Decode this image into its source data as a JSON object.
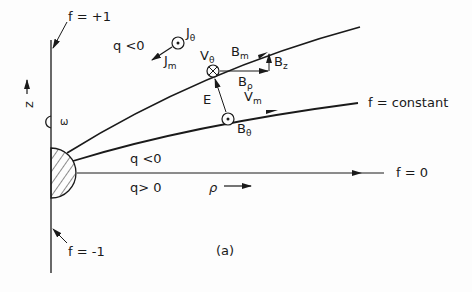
{
  "figure": {
    "caption": "(a)",
    "colors": {
      "ink": "#1a1a1a",
      "background": "#fdfdfd"
    }
  },
  "labels": {
    "f_plus_one": "f = +1",
    "f_minus_one": "f = -1",
    "f_zero": "f = 0",
    "f_constant": "f = constant",
    "q_neg_upper": "q <0",
    "q_neg_lower": "q <0",
    "q_pos": "q> 0",
    "z_axis": "z",
    "rho_axis": "ρ",
    "omega": "ω",
    "J": "J",
    "J_theta_sub": "θ",
    "J_m_sub": "m",
    "V": "V",
    "V_theta_sub": "θ",
    "V_m_sub": "m",
    "B": "B",
    "B_m_sub": "m",
    "B_z_sub": "z",
    "B_rho_sub": "ρ",
    "B_theta_sub": "θ",
    "E": "E"
  }
}
